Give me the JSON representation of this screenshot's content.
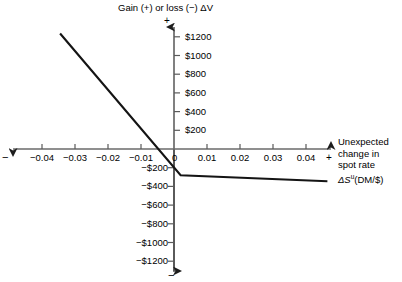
{
  "chart_data": {
    "type": "line",
    "title": "",
    "ylabel": "Gain (+) or loss (−) ΔV",
    "xlabel": "Unexpected change in spot rate ΔSᵘ(DM/$)",
    "xlabel_lines": [
      "Unexpected",
      "change in",
      "spot rate",
      "ΔS"
    ],
    "xlabel_sup": "u",
    "xlabel_tail": "(DM/$)",
    "xlim": [
      -0.05,
      0.047
    ],
    "ylim": [
      -1350,
      1350
    ],
    "grid": false,
    "legend": false,
    "axis_sign_labels": {
      "y_top": "+",
      "y_bottom": "−",
      "x_left": "−",
      "x_right": "+"
    },
    "x_ticks": [
      {
        "value": -0.04,
        "label": "−0.04"
      },
      {
        "value": -0.03,
        "label": "−0.03"
      },
      {
        "value": -0.02,
        "label": "−0.02"
      },
      {
        "value": -0.01,
        "label": "−0.01"
      },
      {
        "value": 0,
        "label": "0"
      },
      {
        "value": 0.01,
        "label": "0.01"
      },
      {
        "value": 0.02,
        "label": "0.02"
      },
      {
        "value": 0.03,
        "label": "0.03"
      },
      {
        "value": 0.04,
        "label": "0.04"
      }
    ],
    "y_ticks_positive": [
      {
        "value": 200,
        "label": "$200"
      },
      {
        "value": 400,
        "label": "$400"
      },
      {
        "value": 600,
        "label": "$600"
      },
      {
        "value": 800,
        "label": "$800"
      },
      {
        "value": 1000,
        "label": "$1000"
      },
      {
        "value": 1200,
        "label": "$1200"
      }
    ],
    "y_ticks_negative": [
      {
        "value": -200,
        "label": "−$200"
      },
      {
        "value": -400,
        "label": "−$400"
      },
      {
        "value": -600,
        "label": "−$600"
      },
      {
        "value": -800,
        "label": "−$800"
      },
      {
        "value": -1000,
        "label": "−$1000"
      },
      {
        "value": -1200,
        "label": "−$1200"
      }
    ],
    "series": [
      {
        "name": "exposure-line",
        "points": [
          {
            "x": -0.0345,
            "y": 1235
          },
          {
            "x": 0.002,
            "y": -280
          },
          {
            "x": 0.0465,
            "y": -345
          }
        ]
      }
    ],
    "line_color": "#111111",
    "axis_color": "#3a3a3a"
  }
}
